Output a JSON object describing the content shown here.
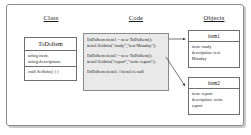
{
  "diagram": {
    "headers": {
      "class": "Class",
      "code": "Code",
      "objects": "Objects"
    },
    "class_box": {
      "name": "ToDoItem",
      "attributes": [
        "string item;",
        "string description;"
      ],
      "operations": [
        "void SetInfo() {}"
      ]
    },
    "code_block": {
      "groups": [
        {
          "lines": [
            "ToDoItem item1 = new ToDoItem();",
            "item1.SetInfo(\"study\",\"test Monday\");"
          ]
        },
        {
          "lines": [
            "ToDoItem item2 = new ToDoItem();",
            "item2.SetInfo(\"report\",\"write report\");"
          ]
        },
        {
          "lines": [
            "ToDoItem item3; //item3 is null"
          ]
        }
      ]
    },
    "objects": [
      {
        "name": "item1",
        "attributes": [
          "item: study",
          "description: test",
          "Monday"
        ]
      },
      {
        "name": "item2",
        "attributes": [
          "item: report",
          "description: write",
          "report"
        ]
      }
    ],
    "connectors": [
      {
        "name": "arrow-code-to-item1",
        "from": "code-group-1",
        "to": "item1"
      },
      {
        "name": "arrow-code-to-item2",
        "from": "code-group-2",
        "to": "item2"
      }
    ],
    "colors": {
      "code_fill": "#e9e9e9",
      "border": "#6f6f6f",
      "frame_border": "#8d8d8d",
      "shadow": "#c9c9c9",
      "text": "#1b1b1b"
    }
  }
}
